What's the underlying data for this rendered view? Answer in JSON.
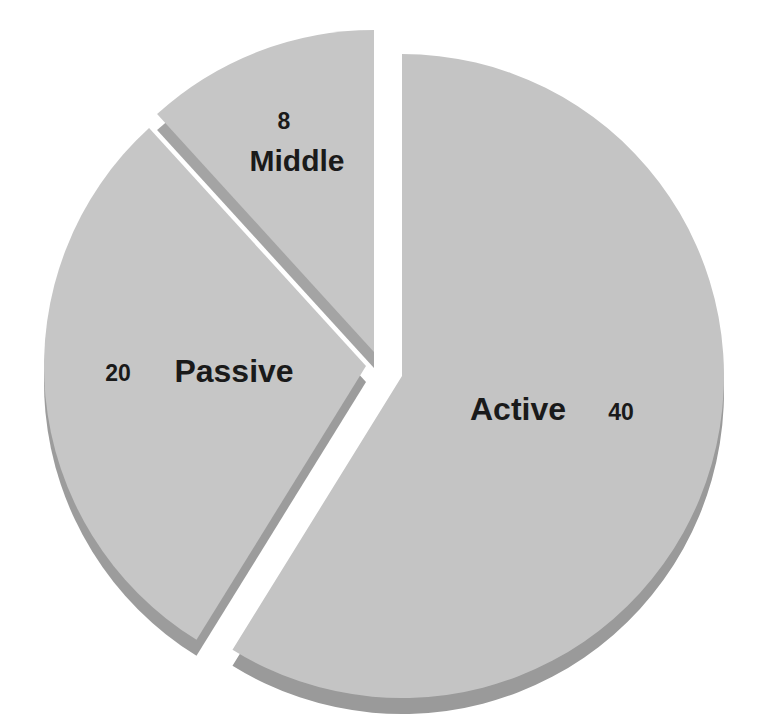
{
  "chart_data": {
    "type": "pie",
    "title": "",
    "style": "3d-exploded",
    "categories": [
      "Active",
      "Passive",
      "Middle"
    ],
    "values": [
      40,
      20,
      8
    ],
    "slices": [
      {
        "label": "Active",
        "value": 40,
        "value_text": "40",
        "color": "#c4c4c4",
        "edge_color": "#9a9a9a",
        "explode": [
          10,
          6
        ]
      },
      {
        "label": "Passive",
        "value": 20,
        "value_text": "20",
        "color": "#c6c6c6",
        "edge_color": "#9c9c9c",
        "explode": [
          -26,
          -4
        ]
      },
      {
        "label": "Middle",
        "value": 8,
        "value_text": "8",
        "color": "#c6c6c6",
        "edge_color": "#a4a4a4",
        "explode": [
          -18,
          -18
        ]
      }
    ],
    "legend": "none",
    "grid": false
  }
}
